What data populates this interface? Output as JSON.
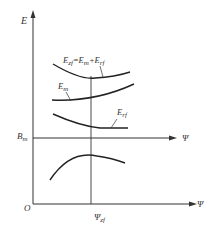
{
  "diagram": {
    "axes": {
      "y_label": "E",
      "origin_label": "O",
      "x_label_bottom": "Ψ",
      "x_label_bm": "Ψ",
      "bm_label": "B",
      "bm_sub": "m",
      "psi_zf_label": "Ψ",
      "psi_zf_sub": "zf"
    },
    "curves": [
      {
        "name": "E_zf",
        "label": "E",
        "sub": "zf",
        "formula_rest": "=E",
        "formula_sub2": "m",
        "formula_plus": "+E",
        "formula_sub3": "rf"
      },
      {
        "name": "E_m",
        "label": "E",
        "sub": "m"
      },
      {
        "name": "E_rf",
        "label": "E",
        "sub": "rf"
      },
      {
        "name": "lower-arch",
        "label": ""
      }
    ],
    "colors": {
      "line": "#333333",
      "background": "#ffffff"
    }
  }
}
